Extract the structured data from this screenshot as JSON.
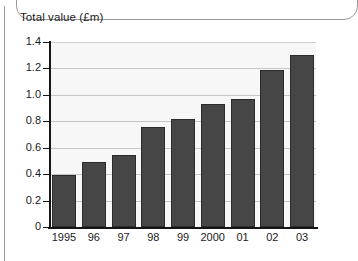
{
  "chart_data": {
    "type": "bar",
    "title": "Total value (£m)",
    "xlabel": "",
    "ylabel": "Total value (£m)",
    "categories": [
      "1995",
      "96",
      "97",
      "98",
      "99",
      "2000",
      "01",
      "02",
      "03"
    ],
    "values": [
      0.39,
      0.49,
      0.545,
      0.76,
      0.815,
      0.93,
      0.97,
      1.185,
      1.3
    ],
    "ylim": [
      0,
      1.4
    ],
    "ytick_labels": [
      "1.4",
      "1.2",
      "1.0",
      "0.8",
      "0.6",
      "0.4",
      "0.2",
      "0"
    ],
    "ytick_values": [
      1.4,
      1.2,
      1.0,
      0.8,
      0.6,
      0.4,
      0.2,
      0
    ],
    "grid": true,
    "legend": "none",
    "series": [
      {
        "name": "Total value",
        "values": [
          0.39,
          0.49,
          0.545,
          0.76,
          0.815,
          0.93,
          0.97,
          1.185,
          1.3
        ]
      }
    ],
    "colors": {
      "bar_fill": "#464646",
      "bar_border": "#2c2c2c",
      "plot_background": "#f7f7f7",
      "gridline": "#c6c6c6",
      "axis": "#151515",
      "text": "#1a1a1a"
    }
  }
}
